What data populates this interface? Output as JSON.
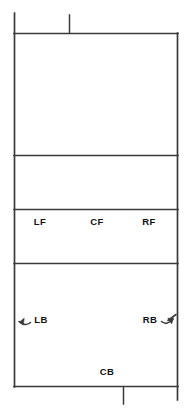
{
  "diagram": {
    "stroke_color": "#3a3a3a",
    "background_color": "#ffffff",
    "label_color": "#111111",
    "court": {
      "left": 14,
      "right": 178,
      "top": 33,
      "bottom": 386
    },
    "dividers": [
      {
        "name": "divider-upper",
        "y": 155
      },
      {
        "name": "divider-middle",
        "y": 209
      },
      {
        "name": "divider-lower",
        "y": 263
      }
    ],
    "ticks": [
      {
        "name": "tick-top-left",
        "x": 14,
        "y1": 13,
        "y2": 33
      },
      {
        "name": "tick-top-center",
        "x": 69,
        "y1": 15,
        "y2": 33
      },
      {
        "name": "tick-bottom-center",
        "x": 123,
        "y1": 386,
        "y2": 404
      },
      {
        "name": "tick-bottom-right",
        "x": 178,
        "y1": 386,
        "y2": 400
      }
    ],
    "zones": [
      {
        "id": "LF",
        "label": "LF",
        "x": 40,
        "y": 222,
        "description": "left front"
      },
      {
        "id": "CF",
        "label": "CF",
        "x": 97,
        "y": 222,
        "description": "center front"
      },
      {
        "id": "RF",
        "label": "RF",
        "x": 149,
        "y": 222,
        "description": "right front"
      },
      {
        "id": "LB",
        "label": "LB",
        "x": 41,
        "y": 320,
        "description": "left back"
      },
      {
        "id": "RB",
        "label": "RB",
        "x": 150,
        "y": 320,
        "description": "right back"
      },
      {
        "id": "CB",
        "label": "CB",
        "x": 107,
        "y": 372,
        "description": "center back"
      }
    ],
    "arrows": [
      {
        "id": "lb-arrow",
        "name": "left-back-arrow",
        "direction": "left",
        "tip_x": 12,
        "tip_y": 320
      },
      {
        "id": "rb-arrow",
        "name": "right-back-arrow",
        "direction": "right",
        "tip_x": 182,
        "tip_y": 316
      }
    ]
  }
}
